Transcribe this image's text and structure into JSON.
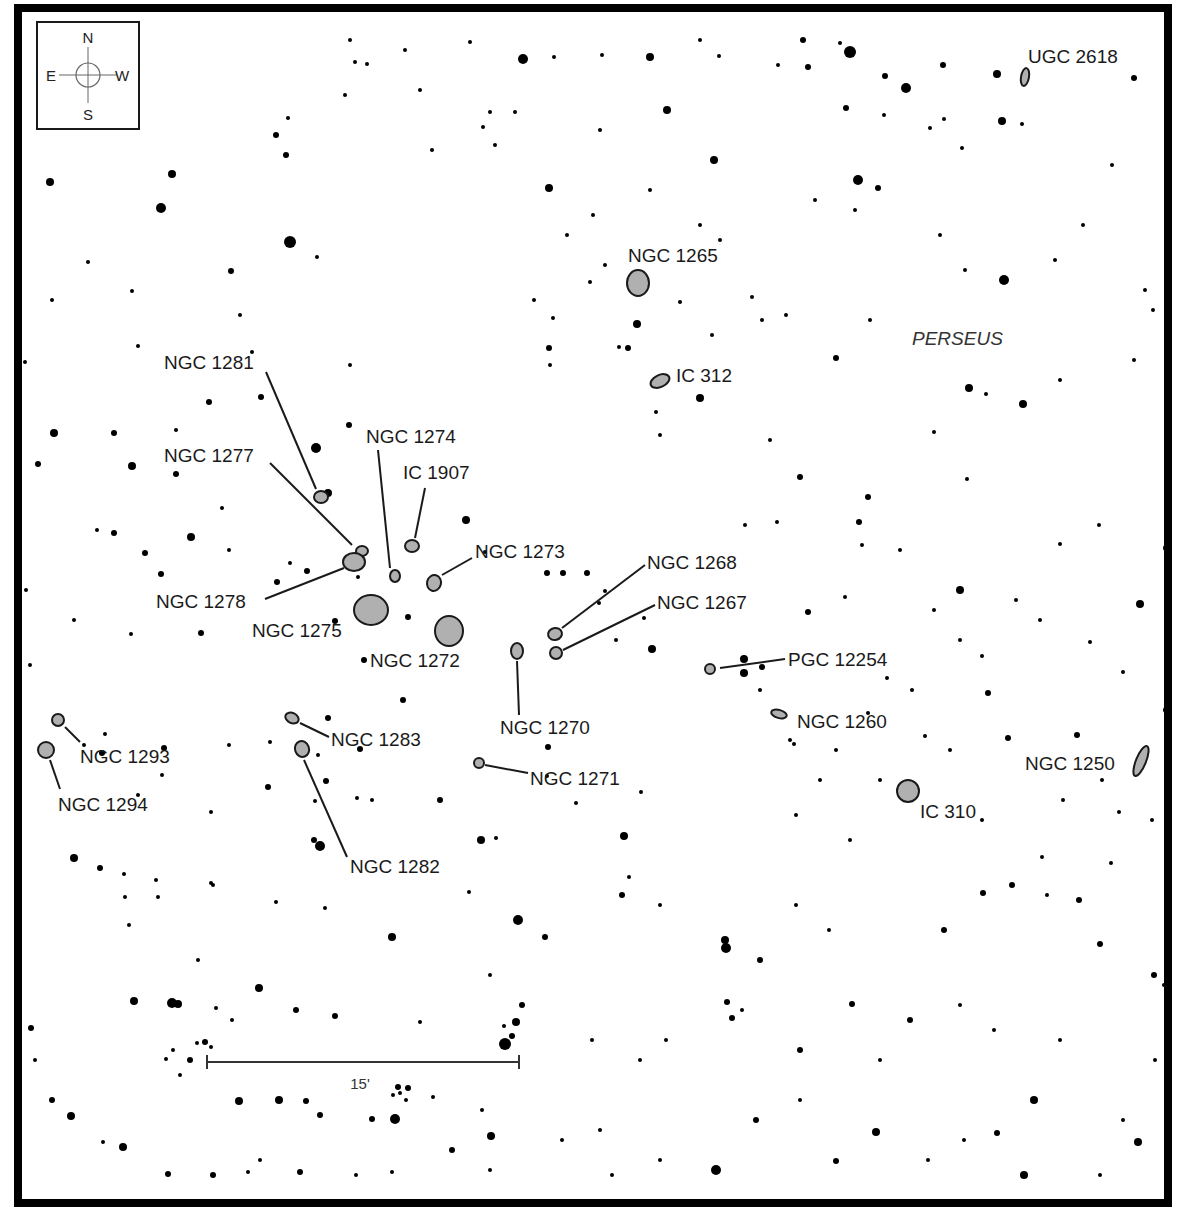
{
  "map": {
    "constellation": "PERSEUS",
    "compass": {
      "N": "N",
      "S": "S",
      "E": "E",
      "W": "W"
    },
    "scale_bar": {
      "label": "15'"
    },
    "colors": {
      "galaxy_fill": "#b0b0b0",
      "galaxy_stroke": "#1a1a1a",
      "star": "#000000",
      "frame": "#000000"
    }
  },
  "galaxies": [
    {
      "name": "UGC 2618",
      "cx": 1025,
      "cy": 77,
      "rx": 4,
      "ry": 9,
      "rot": 10,
      "lx": 1028,
      "ly": 63,
      "line": null
    },
    {
      "name": "NGC 1265",
      "cx": 638,
      "cy": 283,
      "rx": 11,
      "ry": 13,
      "rot": 0,
      "lx": 628,
      "ly": 262,
      "line": null
    },
    {
      "name": "IC 312",
      "cx": 660,
      "cy": 381,
      "rx": 10,
      "ry": 6,
      "rot": -25,
      "lx": 676,
      "ly": 382,
      "line": null
    },
    {
      "name": "NGC 1281",
      "cx": 321,
      "cy": 497,
      "rx": 7,
      "ry": 6,
      "rot": 0,
      "lx": 164,
      "ly": 369,
      "line": [
        266,
        372,
        316,
        489
      ]
    },
    {
      "name": "NGC 1277",
      "cx": 362,
      "cy": 551,
      "rx": 6,
      "ry": 5,
      "rot": 0,
      "lx": 164,
      "ly": 462,
      "line": [
        270,
        463,
        352,
        545
      ]
    },
    {
      "name": "NGC 1274",
      "cx": 395,
      "cy": 576,
      "rx": 5,
      "ry": 6,
      "rot": 0,
      "lx": 366,
      "ly": 443,
      "line": [
        378,
        450,
        390,
        568
      ]
    },
    {
      "name": "IC 1907",
      "cx": 412,
      "cy": 546,
      "rx": 7,
      "ry": 6,
      "rot": 0,
      "lx": 403,
      "ly": 479,
      "line": [
        425,
        488,
        415,
        538
      ]
    },
    {
      "name": "NGC 1273",
      "cx": 434,
      "cy": 583,
      "rx": 7,
      "ry": 8,
      "rot": 15,
      "lx": 475,
      "ly": 558,
      "line": [
        472,
        558,
        442,
        575
      ]
    },
    {
      "name": "NGC 1278",
      "cx": 354,
      "cy": 562,
      "rx": 11,
      "ry": 9,
      "rot": 0,
      "lx": 156,
      "ly": 608,
      "line": [
        265,
        599,
        344,
        568
      ]
    },
    {
      "name": "NGC 1275",
      "cx": 371,
      "cy": 610,
      "rx": 17,
      "ry": 15,
      "rot": 0,
      "lx": 252,
      "ly": 637,
      "line": null
    },
    {
      "name": "NGC 1272",
      "cx": 449,
      "cy": 631,
      "rx": 14,
      "ry": 15,
      "rot": 0,
      "lx": 370,
      "ly": 667,
      "line": null
    },
    {
      "name": "NGC 1268",
      "cx": 555,
      "cy": 634,
      "rx": 7,
      "ry": 6,
      "rot": -15,
      "lx": 647,
      "ly": 569,
      "line": [
        645,
        565,
        562,
        628
      ]
    },
    {
      "name": "NGC 1267",
      "cx": 556,
      "cy": 653,
      "rx": 6,
      "ry": 6,
      "rot": 0,
      "lx": 657,
      "ly": 609,
      "line": [
        655,
        605,
        563,
        650
      ]
    },
    {
      "name": "NGC 1270",
      "cx": 517,
      "cy": 651,
      "rx": 6,
      "ry": 8,
      "rot": 0,
      "lx": 500,
      "ly": 734,
      "line": [
        517,
        661,
        519,
        715
      ]
    },
    {
      "name": "PGC 12254",
      "cx": 710,
      "cy": 669,
      "rx": 5,
      "ry": 5,
      "rot": 0,
      "lx": 788,
      "ly": 666,
      "line": [
        720,
        668,
        785,
        659
      ]
    },
    {
      "name": "NGC 1260",
      "cx": 779,
      "cy": 714,
      "rx": 8,
      "ry": 4,
      "rot": 15,
      "lx": 797,
      "ly": 728,
      "line": null
    },
    {
      "name": "NGC 1293",
      "cx": 58,
      "cy": 720,
      "rx": 6,
      "ry": 6,
      "rot": 0,
      "lx": 80,
      "ly": 763,
      "line": [
        65,
        727,
        80,
        742
      ]
    },
    {
      "name": "NGC 1294",
      "cx": 46,
      "cy": 750,
      "rx": 8,
      "ry": 8,
      "rot": 0,
      "lx": 58,
      "ly": 811,
      "line": [
        50,
        760,
        60,
        789
      ]
    },
    {
      "name": "NGC 1283",
      "cx": 292,
      "cy": 718,
      "rx": 7,
      "ry": 5,
      "rot": 25,
      "lx": 331,
      "ly": 746,
      "line": [
        300,
        723,
        329,
        737
      ]
    },
    {
      "name": "NGC 1282",
      "cx": 302,
      "cy": 749,
      "rx": 7,
      "ry": 8,
      "rot": -20,
      "lx": 350,
      "ly": 873,
      "line": [
        304,
        760,
        347,
        857
      ]
    },
    {
      "name": "NGC 1271",
      "cx": 479,
      "cy": 763,
      "rx": 5,
      "ry": 5,
      "rot": 0,
      "lx": 530,
      "ly": 785,
      "line": [
        485,
        765,
        528,
        773
      ]
    },
    {
      "name": "IC 310",
      "cx": 908,
      "cy": 791,
      "rx": 11,
      "ry": 11,
      "rot": 0,
      "lx": 920,
      "ly": 818,
      "line": null
    },
    {
      "name": "NGC 1250",
      "cx": 1141,
      "cy": 761,
      "rx": 5,
      "ry": 16,
      "rot": 22,
      "lx": 1025,
      "ly": 770,
      "line": null
    }
  ],
  "stars": [
    [
      523,
      59,
      5
    ],
    [
      650,
      57,
      4
    ],
    [
      803,
      40,
      3
    ],
    [
      850,
      52,
      6
    ],
    [
      808,
      67,
      3
    ],
    [
      885,
      76,
      3
    ],
    [
      906,
      88,
      5
    ],
    [
      943,
      65,
      3
    ],
    [
      997,
      74,
      4
    ],
    [
      1134,
      78,
      3
    ],
    [
      1002,
      121,
      4
    ],
    [
      1022,
      124,
      2
    ],
    [
      350,
      40,
      2
    ],
    [
      355,
      62,
      2
    ],
    [
      367,
      64,
      2
    ],
    [
      405,
      50,
      2
    ],
    [
      470,
      42,
      2
    ],
    [
      554,
      57,
      2
    ],
    [
      602,
      55,
      2
    ],
    [
      700,
      40,
      2
    ],
    [
      719,
      56,
      2
    ],
    [
      778,
      65,
      2
    ],
    [
      840,
      43,
      2
    ],
    [
      667,
      110,
      4
    ],
    [
      714,
      160,
      4
    ],
    [
      549,
      188,
      4
    ],
    [
      858,
      180,
      5
    ],
    [
      878,
      188,
      3
    ],
    [
      846,
      108,
      3
    ],
    [
      884,
      115,
      2
    ],
    [
      944,
      119,
      2
    ],
    [
      962,
      148,
      2
    ],
    [
      930,
      128,
      2
    ],
    [
      50,
      182,
      4
    ],
    [
      172,
      174,
      4
    ],
    [
      161,
      208,
      5
    ],
    [
      290,
      242,
      6
    ],
    [
      231,
      271,
      3
    ],
    [
      317,
      257,
      2
    ],
    [
      276,
      135,
      3
    ],
    [
      286,
      155,
      3
    ],
    [
      288,
      118,
      2
    ],
    [
      345,
      95,
      2
    ],
    [
      420,
      90,
      2
    ],
    [
      483,
      127,
      2
    ],
    [
      490,
      112,
      2
    ],
    [
      515,
      112,
      2
    ],
    [
      432,
      150,
      2
    ],
    [
      495,
      145,
      2
    ],
    [
      600,
      130,
      2
    ],
    [
      650,
      190,
      2
    ],
    [
      700,
      225,
      2
    ],
    [
      720,
      240,
      2
    ],
    [
      815,
      200,
      2
    ],
    [
      855,
      210,
      2
    ],
    [
      1004,
      280,
      5
    ],
    [
      1083,
      225,
      2
    ],
    [
      1112,
      165,
      2
    ],
    [
      637,
      324,
      4
    ],
    [
      628,
      348,
      3
    ],
    [
      712,
      335,
      2
    ],
    [
      762,
      320,
      2
    ],
    [
      836,
      358,
      3
    ],
    [
      1023,
      404,
      4
    ],
    [
      969,
      388,
      4
    ],
    [
      986,
      394,
      2
    ],
    [
      1060,
      380,
      2
    ],
    [
      1134,
      360,
      2
    ],
    [
      1153,
      310,
      2
    ],
    [
      54,
      433,
      4
    ],
    [
      38,
      464,
      3
    ],
    [
      114,
      433,
      3
    ],
    [
      132,
      466,
      4
    ],
    [
      176,
      474,
      3
    ],
    [
      261,
      397,
      3
    ],
    [
      209,
      402,
      3
    ],
    [
      316,
      448,
      5
    ],
    [
      328,
      493,
      4
    ],
    [
      349,
      425,
      3
    ],
    [
      350,
      365,
      2
    ],
    [
      549,
      348,
      3
    ],
    [
      550,
      365,
      2
    ],
    [
      619,
      347,
      2
    ],
    [
      700,
      398,
      4
    ],
    [
      656,
      412,
      2
    ],
    [
      660,
      435,
      2
    ],
    [
      770,
      440,
      2
    ],
    [
      800,
      477,
      3
    ],
    [
      868,
      497,
      3
    ],
    [
      859,
      522,
      3
    ],
    [
      934,
      432,
      2
    ],
    [
      967,
      479,
      2
    ],
    [
      114,
      533,
      3
    ],
    [
      145,
      553,
      3
    ],
    [
      191,
      537,
      4
    ],
    [
      161,
      574,
      3
    ],
    [
      229,
      550,
      2
    ],
    [
      201,
      633,
      3
    ],
    [
      290,
      563,
      2
    ],
    [
      277,
      582,
      3
    ],
    [
      307,
      571,
      3
    ],
    [
      335,
      621,
      3
    ],
    [
      358,
      577,
      2
    ],
    [
      408,
      617,
      3
    ],
    [
      466,
      520,
      4
    ],
    [
      485,
      552,
      2
    ],
    [
      547,
      573,
      3
    ],
    [
      563,
      573,
      3
    ],
    [
      587,
      573,
      3
    ],
    [
      599,
      603,
      2
    ],
    [
      616,
      640,
      2
    ],
    [
      605,
      591,
      2
    ],
    [
      644,
      618,
      2
    ],
    [
      652,
      649,
      4
    ],
    [
      744,
      659,
      4
    ],
    [
      762,
      667,
      3
    ],
    [
      744,
      673,
      4
    ],
    [
      808,
      612,
      3
    ],
    [
      845,
      597,
      2
    ],
    [
      960,
      590,
      4
    ],
    [
      1140,
      604,
      4
    ],
    [
      1166,
      548,
      3
    ],
    [
      1060,
      544,
      2
    ],
    [
      1099,
      525,
      2
    ],
    [
      988,
      693,
      3
    ],
    [
      1008,
      738,
      3
    ],
    [
      982,
      656,
      2
    ],
    [
      1166,
      710,
      3
    ],
    [
      1077,
      735,
      3
    ],
    [
      1102,
      780,
      2
    ],
    [
      403,
      700,
      3
    ],
    [
      364,
      660,
      3
    ],
    [
      328,
      718,
      3
    ],
    [
      318,
      755,
      2
    ],
    [
      360,
      749,
      3
    ],
    [
      326,
      781,
      3
    ],
    [
      315,
      801,
      2
    ],
    [
      357,
      798,
      2
    ],
    [
      372,
      800,
      2
    ],
    [
      440,
      800,
      3
    ],
    [
      481,
      840,
      4
    ],
    [
      496,
      838,
      2
    ],
    [
      576,
      803,
      2
    ],
    [
      624,
      836,
      4
    ],
    [
      105,
      734,
      2
    ],
    [
      102,
      753,
      3
    ],
    [
      84,
      745,
      2
    ],
    [
      164,
      748,
      3
    ],
    [
      162,
      775,
      2
    ],
    [
      270,
      742,
      2
    ],
    [
      268,
      787,
      3
    ],
    [
      138,
      795,
      2
    ],
    [
      211,
      812,
      2
    ],
    [
      229,
      745,
      2
    ],
    [
      548,
      747,
      3
    ],
    [
      547,
      776,
      2
    ],
    [
      641,
      792,
      2
    ],
    [
      74,
      858,
      4
    ],
    [
      100,
      868,
      3
    ],
    [
      124,
      874,
      2
    ],
    [
      125,
      897,
      2
    ],
    [
      129,
      925,
      2
    ],
    [
      156,
      880,
      2
    ],
    [
      158,
      897,
      2
    ],
    [
      211,
      883,
      2
    ],
    [
      213,
      885,
      2
    ],
    [
      198,
      960,
      2
    ],
    [
      276,
      902,
      2
    ],
    [
      320,
      846,
      5
    ],
    [
      314,
      840,
      3
    ],
    [
      325,
      908,
      2
    ],
    [
      518,
      920,
      5
    ],
    [
      469,
      892,
      2
    ],
    [
      545,
      937,
      3
    ],
    [
      622,
      895,
      3
    ],
    [
      629,
      877,
      2
    ],
    [
      660,
      905,
      2
    ],
    [
      725,
      940,
      4
    ],
    [
      726,
      948,
      5
    ],
    [
      760,
      960,
      3
    ],
    [
      796,
      905,
      2
    ],
    [
      829,
      930,
      2
    ],
    [
      944,
      930,
      3
    ],
    [
      983,
      893,
      3
    ],
    [
      1012,
      885,
      3
    ],
    [
      1047,
      895,
      2
    ],
    [
      1079,
      900,
      3
    ],
    [
      1111,
      863,
      2
    ],
    [
      1100,
      944,
      3
    ],
    [
      1154,
      975,
      3
    ],
    [
      1164,
      985,
      2
    ],
    [
      172,
      1003,
      5
    ],
    [
      178,
      1004,
      4
    ],
    [
      134,
      1001,
      4
    ],
    [
      216,
      1008,
      2
    ],
    [
      259,
      988,
      4
    ],
    [
      232,
      1020,
      2
    ],
    [
      296,
      1010,
      3
    ],
    [
      335,
      1016,
      3
    ],
    [
      392,
      937,
      4
    ],
    [
      420,
      1022,
      2
    ],
    [
      490,
      975,
      2
    ],
    [
      522,
      1005,
      3
    ],
    [
      516,
      1022,
      4
    ],
    [
      512,
      1036,
      3
    ],
    [
      505,
      1044,
      6
    ],
    [
      504,
      1026,
      2
    ],
    [
      205,
      1042,
      3
    ],
    [
      211,
      1047,
      2
    ],
    [
      197,
      1043,
      2
    ],
    [
      190,
      1060,
      3
    ],
    [
      173,
      1050,
      2
    ],
    [
      166,
      1059,
      2
    ],
    [
      180,
      1075,
      2
    ],
    [
      239,
      1101,
      4
    ],
    [
      279,
      1100,
      4
    ],
    [
      306,
      1101,
      3
    ],
    [
      320,
      1115,
      3
    ],
    [
      372,
      1119,
      3
    ],
    [
      395,
      1119,
      5
    ],
    [
      398,
      1087,
      3
    ],
    [
      408,
      1088,
      3
    ],
    [
      400,
      1093,
      2
    ],
    [
      393,
      1095,
      2
    ],
    [
      406,
      1100,
      2
    ],
    [
      433,
      1097,
      2
    ],
    [
      482,
      1110,
      2
    ],
    [
      491,
      1136,
      4
    ],
    [
      31,
      1028,
      3
    ],
    [
      35,
      1060,
      2
    ],
    [
      52,
      1100,
      3
    ],
    [
      71,
      1116,
      4
    ],
    [
      103,
      1142,
      2
    ],
    [
      123,
      1147,
      4
    ],
    [
      168,
      1174,
      3
    ],
    [
      213,
      1175,
      3
    ],
    [
      248,
      1172,
      2
    ],
    [
      260,
      1160,
      2
    ],
    [
      300,
      1172,
      3
    ],
    [
      356,
      1175,
      2
    ],
    [
      392,
      1172,
      2
    ],
    [
      452,
      1150,
      3
    ],
    [
      490,
      1170,
      2
    ],
    [
      562,
      1140,
      2
    ],
    [
      600,
      1130,
      2
    ],
    [
      612,
      1175,
      2
    ],
    [
      660,
      1160,
      2
    ],
    [
      716,
      1170,
      5
    ],
    [
      756,
      1120,
      3
    ],
    [
      800,
      1100,
      2
    ],
    [
      836,
      1161,
      3
    ],
    [
      876,
      1132,
      4
    ],
    [
      928,
      1160,
      2
    ],
    [
      964,
      1140,
      2
    ],
    [
      997,
      1133,
      3
    ],
    [
      1024,
      1175,
      4
    ],
    [
      1034,
      1100,
      4
    ],
    [
      1123,
      1120,
      2
    ],
    [
      1138,
      1142,
      4
    ],
    [
      1100,
      1175,
      2
    ],
    [
      592,
      1040,
      2
    ],
    [
      640,
      1060,
      2
    ],
    [
      666,
      1040,
      2
    ],
    [
      727,
      1002,
      3
    ],
    [
      732,
      1018,
      3
    ],
    [
      742,
      1010,
      2
    ],
    [
      800,
      1050,
      3
    ],
    [
      852,
      1004,
      3
    ],
    [
      880,
      1060,
      2
    ],
    [
      910,
      1020,
      3
    ],
    [
      960,
      1005,
      2
    ],
    [
      994,
      1030,
      2
    ],
    [
      1060,
      1040,
      2
    ],
    [
      1155,
      1060,
      2
    ],
    [
      138,
      346,
      2
    ],
    [
      132,
      291,
      2
    ],
    [
      52,
      300,
      2
    ],
    [
      88,
      262,
      2
    ],
    [
      25,
      362,
      2
    ],
    [
      97,
      530,
      2
    ],
    [
      26,
      590,
      2
    ],
    [
      74,
      620,
      2
    ],
    [
      131,
      634,
      2
    ],
    [
      30,
      665,
      2
    ],
    [
      240,
      315,
      2
    ],
    [
      252,
      352,
      2
    ],
    [
      176,
      430,
      2
    ],
    [
      222,
      508,
      2
    ],
    [
      553,
      318,
      2
    ],
    [
      534,
      300,
      2
    ],
    [
      567,
      235,
      2
    ],
    [
      593,
      215,
      2
    ],
    [
      590,
      282,
      2
    ],
    [
      605,
      265,
      2
    ],
    [
      680,
      302,
      2
    ],
    [
      752,
      297,
      2
    ],
    [
      786,
      315,
      2
    ],
    [
      870,
      320,
      2
    ],
    [
      940,
      235,
      2
    ],
    [
      965,
      270,
      2
    ],
    [
      1055,
      260,
      2
    ],
    [
      1145,
      290,
      2
    ],
    [
      745,
      525,
      2
    ],
    [
      777,
      522,
      2
    ],
    [
      862,
      545,
      2
    ],
    [
      900,
      550,
      2
    ],
    [
      934,
      610,
      2
    ],
    [
      960,
      640,
      2
    ],
    [
      1040,
      620,
      2
    ],
    [
      1090,
      642,
      2
    ],
    [
      1123,
      672,
      2
    ],
    [
      1016,
      600,
      2
    ],
    [
      912,
      690,
      2
    ],
    [
      950,
      750,
      2
    ],
    [
      1063,
      800,
      2
    ],
    [
      1119,
      812,
      2
    ],
    [
      1042,
      857,
      2
    ],
    [
      1152,
      820,
      2
    ],
    [
      760,
      690,
      2
    ],
    [
      790,
      740,
      2
    ],
    [
      794,
      744,
      2
    ],
    [
      836,
      750,
      2
    ],
    [
      868,
      713,
      2
    ],
    [
      925,
      736,
      2
    ],
    [
      887,
      678,
      2
    ],
    [
      820,
      780,
      2
    ],
    [
      796,
      815,
      2
    ],
    [
      850,
      840,
      2
    ],
    [
      880,
      780,
      2
    ],
    [
      982,
      820,
      2
    ]
  ]
}
